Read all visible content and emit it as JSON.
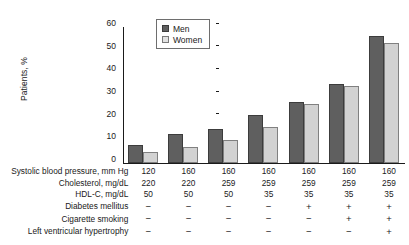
{
  "chart_data": {
    "type": "bar",
    "title": "",
    "xlabel": "",
    "ylabel": "Patients, %",
    "ylim": [
      0,
      60
    ],
    "yticks": [
      0,
      10,
      20,
      30,
      40,
      50,
      60
    ],
    "grid": false,
    "legend_position": "top-left-inside",
    "categories": [
      "1",
      "2",
      "3",
      "4",
      "5",
      "6",
      "7"
    ],
    "series": [
      {
        "name": "Men",
        "color": "#5f5f5f",
        "values": [
          8,
          13,
          15,
          21,
          27,
          35,
          56
        ]
      },
      {
        "name": "Women",
        "color": "#d2d2d2",
        "values": [
          5,
          7,
          10,
          16,
          26,
          34,
          53
        ]
      }
    ],
    "risk_factor_table": {
      "rows": [
        {
          "label": "Systolic blood pressure, mm Hg",
          "values": [
            "120",
            "160",
            "160",
            "160",
            "160",
            "160",
            "160"
          ]
        },
        {
          "label": "Cholesterol, mg/dL",
          "values": [
            "220",
            "220",
            "259",
            "259",
            "259",
            "259",
            "259"
          ]
        },
        {
          "label": "HDL-C, mg/dL",
          "values": [
            "50",
            "50",
            "50",
            "35",
            "35",
            "35",
            "35"
          ]
        },
        {
          "label": "Diabetes mellitus",
          "values": [
            "−",
            "−",
            "−",
            "−",
            "+",
            "+",
            "+"
          ]
        },
        {
          "label": "Cigarette smoking",
          "values": [
            "−",
            "−",
            "−",
            "−",
            "−",
            "+",
            "+"
          ]
        },
        {
          "label": "Left ventricular hypertrophy",
          "values": [
            "−",
            "−",
            "−",
            "−",
            "−",
            "−",
            "+"
          ]
        }
      ]
    }
  },
  "axis": {
    "y_title": "Patients, %",
    "y_tick_0": "0",
    "y_tick_10": "10",
    "y_tick_20": "20",
    "y_tick_30": "30",
    "y_tick_40": "40",
    "y_tick_50": "50",
    "y_tick_60": "60"
  },
  "legend": {
    "men_label": "Men",
    "women_label": "Women"
  }
}
